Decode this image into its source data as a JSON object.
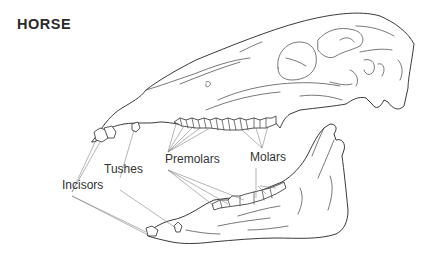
{
  "title": "HORSE",
  "labels": {
    "incisors": "Incisors",
    "tushes": "Tushes",
    "premolars": "Premolars",
    "molars": "Molars"
  },
  "colors": {
    "line": "#3a3a3a",
    "leader": "#777777",
    "text": "#333333",
    "background": "#ffffff"
  }
}
